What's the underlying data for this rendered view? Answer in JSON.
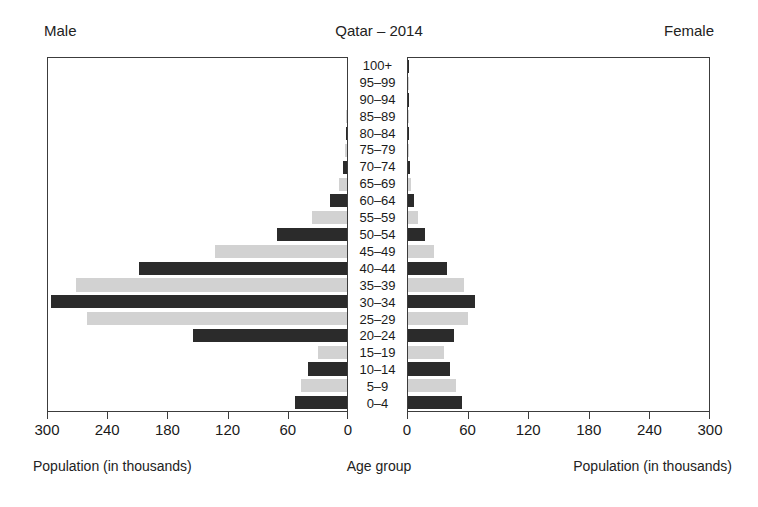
{
  "header": {
    "left_label": "Male",
    "title": "Qatar – 2014",
    "right_label": "Female"
  },
  "captions": {
    "left": "Population (in thousands)",
    "center": "Age group",
    "right": "Population (in thousands)"
  },
  "axis": {
    "left_ticks": [
      "300",
      "240",
      "180",
      "120",
      "60",
      "0"
    ],
    "right_ticks": [
      "0",
      "60",
      "120",
      "180",
      "240",
      "300"
    ]
  },
  "colors": {
    "dark_bar": "#2b2b2b",
    "light_bar": "#d2d2d2",
    "frame": "#3c3c3c",
    "background": "#ffffff",
    "text": "#1a1a1a"
  },
  "chart_data": {
    "type": "bar",
    "subtype": "population-pyramid",
    "title": "Qatar – 2014",
    "xlabel": "Population (in thousands)",
    "ylabel": "Age group",
    "xlim": [
      0,
      300
    ],
    "xticks": [
      0,
      60,
      120,
      180,
      240,
      300
    ],
    "grid": false,
    "legend": "none",
    "units": "thousands",
    "left_panel": "Male",
    "right_panel": "Female",
    "bar_fill_alternates": [
      "dark",
      "light"
    ],
    "categories": [
      "0–4",
      "5–9",
      "10–14",
      "15–19",
      "20–24",
      "25–29",
      "30–34",
      "35–39",
      "40–44",
      "45–49",
      "50–54",
      "55–59",
      "60–64",
      "65–69",
      "70–74",
      "75–79",
      "80–84",
      "85–89",
      "90–94",
      "95–99",
      "100+"
    ],
    "categories_top_down": [
      "100+",
      "95–99",
      "90–94",
      "85–89",
      "80–84",
      "75–79",
      "70–74",
      "65–69",
      "60–64",
      "55–59",
      "50–54",
      "45–49",
      "40–44",
      "35–39",
      "30–34",
      "25–29",
      "20–24",
      "15–19",
      "10–14",
      "5–9",
      "0–4"
    ],
    "series": [
      {
        "name": "Male",
        "side": "left",
        "values": [
          52,
          46,
          39,
          29,
          155,
          261,
          297,
          272,
          209,
          132,
          70,
          35,
          17,
          8,
          4,
          2,
          1,
          1,
          0.5,
          0.3,
          0.2
        ]
      },
      {
        "name": "Female",
        "side": "right",
        "values": [
          54,
          48,
          42,
          36,
          46,
          60,
          67,
          56,
          39,
          26,
          17,
          10,
          6,
          3,
          2,
          1,
          0.8,
          0.5,
          0.3,
          0.2,
          0.1
        ]
      }
    ],
    "rows": [
      {
        "age": "100+",
        "male": 0.2,
        "female": 0.1,
        "fill": "dark"
      },
      {
        "age": "95–99",
        "male": 0.3,
        "female": 0.2,
        "fill": "light"
      },
      {
        "age": "90–94",
        "male": 0.5,
        "female": 0.3,
        "fill": "dark"
      },
      {
        "age": "85–89",
        "male": 1,
        "female": 0.5,
        "fill": "light"
      },
      {
        "age": "80–84",
        "male": 1,
        "female": 0.8,
        "fill": "dark"
      },
      {
        "age": "75–79",
        "male": 2,
        "female": 1,
        "fill": "light"
      },
      {
        "age": "70–74",
        "male": 4,
        "female": 2,
        "fill": "dark"
      },
      {
        "age": "65–69",
        "male": 8,
        "female": 3,
        "fill": "light"
      },
      {
        "age": "60–64",
        "male": 17,
        "female": 6,
        "fill": "dark"
      },
      {
        "age": "55–59",
        "male": 35,
        "female": 10,
        "fill": "light"
      },
      {
        "age": "50–54",
        "male": 70,
        "female": 17,
        "fill": "dark"
      },
      {
        "age": "45–49",
        "male": 132,
        "female": 26,
        "fill": "light"
      },
      {
        "age": "40–44",
        "male": 209,
        "female": 39,
        "fill": "dark"
      },
      {
        "age": "35–39",
        "male": 272,
        "female": 56,
        "fill": "light"
      },
      {
        "age": "30–34",
        "male": 297,
        "female": 67,
        "fill": "dark"
      },
      {
        "age": "25–29",
        "male": 261,
        "female": 60,
        "fill": "light"
      },
      {
        "age": "20–24",
        "male": 155,
        "female": 46,
        "fill": "dark"
      },
      {
        "age": "15–19",
        "male": 29,
        "female": 36,
        "fill": "light"
      },
      {
        "age": "10–14",
        "male": 39,
        "female": 42,
        "fill": "dark"
      },
      {
        "age": "5–9",
        "male": 46,
        "female": 48,
        "fill": "light"
      },
      {
        "age": "0–4",
        "male": 52,
        "female": 54,
        "fill": "dark"
      }
    ]
  }
}
